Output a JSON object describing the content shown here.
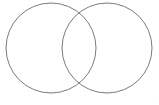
{
  "diagram": {
    "type": "venn",
    "circles": [
      {
        "id": "left",
        "cx": 51,
        "cy": 48,
        "r": 45,
        "stroke": "#7a7a7a"
      },
      {
        "id": "right",
        "cx": 107,
        "cy": 48,
        "r": 45,
        "stroke": "#7a7a7a"
      }
    ],
    "watermark": "· ·"
  }
}
